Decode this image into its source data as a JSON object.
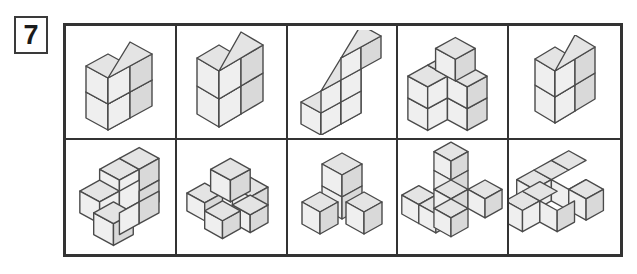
{
  "exercise": {
    "number": "7"
  },
  "colors": {
    "top_face": "#e4e4e4",
    "left_face": "#efefef",
    "right_face": "#d9d9d9",
    "cube_outline": "#4a4a4a",
    "grid_line": "#333333",
    "outer_border": "#333333",
    "badge_border": "#3a3a3a",
    "background": "#ffffff",
    "text": "#1b1b1b"
  },
  "figure": {
    "type": "isometric-cube-puzzle",
    "rows": 2,
    "columns": 5,
    "cube_count_total": 57
  },
  "cells": [
    {
      "index": 1,
      "position": "row1-col1",
      "name": "two-by-two-square-block",
      "cube_count": 6,
      "description": "A 2 wide by 2 high by 2 deep corner block seen from the front-left",
      "cubes": [
        [
          0,
          0,
          0
        ],
        [
          1,
          0,
          0
        ],
        [
          0,
          0,
          1
        ],
        [
          1,
          0,
          1
        ],
        [
          0,
          1,
          0
        ],
        [
          1,
          1,
          0
        ]
      ]
    },
    {
      "index": 2,
      "position": "row1-col2",
      "name": "full-two-cube",
      "cube_count": 8,
      "description": "A solid 2 by 2 by 2 cube",
      "cubes": [
        [
          0,
          0,
          0
        ],
        [
          1,
          0,
          0
        ],
        [
          0,
          0,
          1
        ],
        [
          1,
          0,
          1
        ],
        [
          0,
          1,
          0
        ],
        [
          1,
          1,
          0
        ],
        [
          0,
          1,
          1
        ],
        [
          1,
          1,
          1
        ]
      ]
    },
    {
      "index": 3,
      "position": "row1-col3",
      "name": "staircase-three-step",
      "cube_count": 6,
      "description": "A three step staircase with column heights 1, 2 and 3",
      "cubes": [
        [
          0,
          0,
          0
        ],
        [
          1,
          0,
          0
        ],
        [
          2,
          0,
          0
        ],
        [
          1,
          1,
          0
        ],
        [
          2,
          1,
          0
        ],
        [
          2,
          2,
          0
        ]
      ]
    },
    {
      "index": 4,
      "position": "row1-col4",
      "name": "base-block-with-tower",
      "cube_count": 8,
      "description": "A 3 by 2 base slab with a single cube raised on the middle back position",
      "cubes": [
        [
          0,
          0,
          0
        ],
        [
          1,
          0,
          0
        ],
        [
          2,
          0,
          0
        ],
        [
          0,
          0,
          1
        ],
        [
          1,
          0,
          1
        ],
        [
          2,
          0,
          1
        ],
        [
          1,
          1,
          1
        ],
        [
          1,
          2,
          1
        ]
      ]
    },
    {
      "index": 5,
      "position": "row1-col5",
      "name": "small-four-cube-block",
      "cube_count": 4,
      "description": "A compact 2 by 2 block of four cubes",
      "cubes": [
        [
          0,
          0,
          0
        ],
        [
          1,
          0,
          0
        ],
        [
          0,
          1,
          0
        ],
        [
          1,
          1,
          0
        ]
      ]
    },
    {
      "index": 6,
      "position": "row2-col1",
      "name": "stepped-l-structure",
      "cube_count": 7,
      "description": "A lower front row of cubes with a raised rear step of cubes behind it",
      "cubes": [
        [
          0,
          0,
          0
        ],
        [
          1,
          0,
          0
        ],
        [
          2,
          0,
          0
        ],
        [
          1,
          0,
          1
        ],
        [
          2,
          0,
          1
        ],
        [
          1,
          1,
          1
        ],
        [
          2,
          1,
          1
        ]
      ]
    },
    {
      "index": 7,
      "position": "row2-col2",
      "name": "cross-shape-raised-center",
      "cube_count": 5,
      "description": "A plus shaped group of four low cubes with one cube standing higher at the centre",
      "cubes": [
        [
          0,
          1,
          0
        ],
        [
          2,
          1,
          0
        ],
        [
          1,
          0,
          0
        ],
        [
          1,
          2,
          0
        ],
        [
          1,
          1,
          1
        ]
      ]
    },
    {
      "index": 8,
      "position": "row2-col3",
      "name": "t-tower",
      "cube_count": 4,
      "description": "A two cube vertical column with one cube to each side at the base",
      "cubes": [
        [
          0,
          1,
          0
        ],
        [
          1,
          0,
          0
        ],
        [
          1,
          1,
          0
        ],
        [
          1,
          1,
          1
        ]
      ]
    },
    {
      "index": 9,
      "position": "row2-col4",
      "name": "tripod-plus-tower",
      "cube_count": 7,
      "description": "Three arms spreading from a centre cube with a two cube tower rising above the centre",
      "cubes": [
        [
          0,
          1,
          0
        ],
        [
          1,
          1,
          0
        ],
        [
          1,
          0,
          0
        ],
        [
          1,
          2,
          0
        ],
        [
          2,
          1,
          0
        ],
        [
          1,
          1,
          1
        ],
        [
          1,
          1,
          2
        ]
      ]
    },
    {
      "index": 10,
      "position": "row2-col5",
      "name": "wide-stepped-slab",
      "cube_count": 7,
      "description": "A wide two level slab, three cubes across the back raised above a front row with a side step",
      "cubes": [
        [
          0,
          0,
          0
        ],
        [
          1,
          0,
          0
        ],
        [
          2,
          0,
          0
        ],
        [
          3,
          0,
          0
        ],
        [
          0,
          0,
          1
        ],
        [
          1,
          0,
          1
        ],
        [
          2,
          0,
          1
        ]
      ]
    }
  ]
}
